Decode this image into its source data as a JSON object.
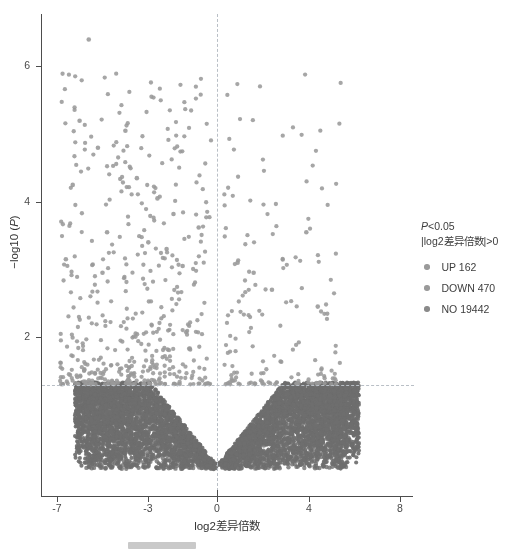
{
  "chart_data": {
    "type": "scatter",
    "title": "",
    "xlabel": "log2差异倍数",
    "ylabel": "−log10 (P)",
    "xlim": [
      -8.2,
      8.6
    ],
    "ylim": [
      0,
      6.9
    ],
    "xticks": [
      -7,
      -3,
      0,
      4,
      8
    ],
    "xtick_labels": [
      "-7",
      "-3",
      "0",
      "4",
      "8"
    ],
    "yticks": [
      2,
      4,
      6
    ],
    "ytick_labels": [
      "2",
      "4",
      "6"
    ],
    "grid": false,
    "legend_position": "right",
    "threshold_lines": {
      "horizontal_y": 1.3,
      "vertical_x": 0,
      "style": "dash-dot",
      "color": "#b9bfc6"
    },
    "series": [
      {
        "name": "UP",
        "count": 162,
        "color": "#9a9a9a",
        "description": "significantly up-regulated, right of x=0 and above y=1.3"
      },
      {
        "name": "DOWN",
        "count": 470,
        "color": "#9a9a9a",
        "description": "significantly down-regulated, left of x=0 and above y=1.3"
      },
      {
        "name": "NO",
        "count": 19442,
        "color": "#6e6e6e",
        "description": "not significant, dense V-shaped cloud below y=1.3"
      }
    ]
  },
  "axes": {
    "x_title": "log2差异倍数",
    "y_title_prefix": "−log10 (",
    "y_title_italic": "P",
    "y_title_suffix": ")",
    "x_ticks": [
      {
        "label": "-7",
        "value": -7
      },
      {
        "label": "-3",
        "value": -3
      },
      {
        "label": "0",
        "value": 0
      },
      {
        "label": "4",
        "value": 4
      },
      {
        "label": "8",
        "value": 8
      }
    ],
    "y_ticks": [
      {
        "label": "2",
        "value": 2
      },
      {
        "label": "4",
        "value": 4
      },
      {
        "label": "6",
        "value": 6
      }
    ]
  },
  "legend": {
    "title_line1_italic": "P",
    "title_line1_rest": "<0.05",
    "title_line2": "|log2差异倍数|>0",
    "entries": [
      {
        "label": "UP 162",
        "color": "#9a9a9a"
      },
      {
        "label": "DOWN 470",
        "color": "#9a9a9a"
      },
      {
        "label": "NO 19442",
        "color": "#8a8a8a"
      }
    ]
  },
  "colors": {
    "axis": "#4d4d4d",
    "text": "#3d3d3d",
    "threshold": "#b9bfc6",
    "point_significant": "#9a9a9a",
    "point_nonsignificant": "#6e6e6e",
    "bottom_bar": "#c9c9c9"
  }
}
